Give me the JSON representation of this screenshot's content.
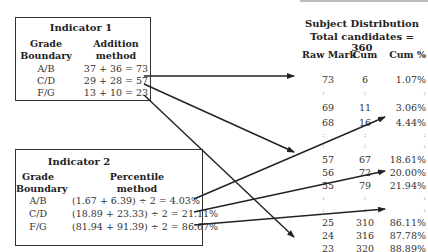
{
  "indicator1": {
    "title": "Indicator 1",
    "col1_header": [
      "Grade",
      "Boundary"
    ],
    "col2_header": [
      "Addition",
      "method"
    ],
    "rows": [
      {
        "grade": "A/B",
        "method": "37 + 36 = 73"
      },
      {
        "grade": "C/D",
        "method": "29 + 28 = 57"
      },
      {
        "grade": "F/G",
        "method": "13 + 10 = 23"
      }
    ]
  },
  "indicator2": {
    "title": "Indicator 2",
    "col1_header": [
      "Grade",
      "Boundary"
    ],
    "col2_header": [
      "Percentile",
      "method"
    ],
    "rows": [
      {
        "grade": "A/B",
        "method": "(1.67 + 6.39) ÷ 2 = 4.03%"
      },
      {
        "grade": "C/D",
        "method": "(18.89 + 23.33) ÷ 2 = 21.11%"
      },
      {
        "grade": "F/G",
        "method": "(81.94 + 91.39) ÷ 2 = 86.67%"
      }
    ]
  },
  "distribution": {
    "title": "Subject Distribution",
    "subtitle": "Total candidates = 360",
    "headers": {
      "raw": "Raw Mark",
      "cum": "Cum",
      "cum_pct": "Cum %"
    },
    "rows": [
      {
        "raw": "73",
        "cum": "6",
        "cum_pct": "1.07%",
        "y": 82
      },
      {
        "raw": ":",
        "cum": ":",
        "cum_pct": ":",
        "y": 96,
        "dots": true
      },
      {
        "raw": "69",
        "cum": "11",
        "cum_pct": "3.06%",
        "y": 110
      },
      {
        "raw": "68",
        "cum": "16",
        "cum_pct": "4.44%",
        "y": 125
      },
      {
        "raw": ":",
        "cum": ":",
        "cum_pct": ":",
        "y": 138,
        "dots": true
      },
      {
        "raw": ":",
        "cum": ":",
        "cum_pct": ":",
        "y": 149,
        "dots": true
      },
      {
        "raw": "57",
        "cum": "67",
        "cum_pct": "18.61%",
        "y": 162
      },
      {
        "raw": "56",
        "cum": "72",
        "cum_pct": "20.00%",
        "y": 175
      },
      {
        "raw": "55",
        "cum": "79",
        "cum_pct": "21.94%",
        "y": 188
      },
      {
        "raw": ":",
        "cum": ":",
        "cum_pct": ":",
        "y": 201,
        "dots": true
      },
      {
        "raw": ":",
        "cum": ":",
        "cum_pct": ":",
        "y": 213,
        "dots": true
      },
      {
        "raw": "25",
        "cum": "310",
        "cum_pct": "86.11%",
        "y": 225
      },
      {
        "raw": "24",
        "cum": "316",
        "cum_pct": "87.78%",
        "y": 238
      },
      {
        "raw": "23",
        "cum": "320",
        "cum_pct": "88.89%",
        "y": 251
      }
    ]
  },
  "arrows": [
    {
      "from": "Indicator 1 A/B (73)",
      "to": "Raw Mark 73",
      "x1": 144,
      "y1": 76,
      "x2": 294,
      "y2": 76
    },
    {
      "from": "Indicator 1 C/D (57)",
      "to": "Raw Mark 57",
      "x1": 144,
      "y1": 84,
      "x2": 294,
      "y2": 152
    },
    {
      "from": "Indicator 1 F/G (23)",
      "to": "Raw Mark 23",
      "x1": 144,
      "y1": 95,
      "x2": 294,
      "y2": 237
    },
    {
      "from": "Indicator 2 A/B (4.03%)",
      "to": "Cum % 4.44%",
      "x1": 194,
      "y1": 199,
      "x2": 385,
      "y2": 117
    },
    {
      "from": "Indicator 2 C/D (21.11%)",
      "to": "Cum % 21.94%",
      "x1": 194,
      "y1": 212,
      "x2": 385,
      "y2": 171
    },
    {
      "from": "Indicator 2 F/G (86.67%)",
      "to": "Cum % 86.11%",
      "x1": 194,
      "y1": 225,
      "x2": 385,
      "y2": 209
    }
  ],
  "colors": {
    "line": "#222222",
    "text": "#333333",
    "dots": "#888888"
  }
}
